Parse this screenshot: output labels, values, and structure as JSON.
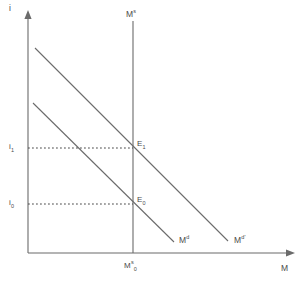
{
  "figure": {
    "type": "economics-line-diagram",
    "background_color": "#ffffff",
    "line_color": "#6b6b6b",
    "text_color": "#4a4a4a"
  },
  "axes": {
    "y": {
      "name": "i",
      "meaning": "interest rate",
      "has_arrow": true,
      "origin_px": [
        28,
        253
      ],
      "end_px": [
        28,
        14
      ]
    },
    "x": {
      "name": "M",
      "meaning": "quantity of money",
      "has_arrow": true,
      "origin_px": [
        28,
        253
      ],
      "end_px": [
        292,
        253
      ]
    }
  },
  "ticks": {
    "y": [
      {
        "label_main": "i",
        "label_sub": "1",
        "y_px": 148
      },
      {
        "label_main": "i",
        "label_sub": "0",
        "y_px": 204
      }
    ],
    "x": [
      {
        "label_main": "M",
        "label_sup": "s",
        "label_sub": "0",
        "x_px": 133
      }
    ]
  },
  "curves": [
    {
      "id": "money-supply",
      "label_main": "M",
      "label_sup": "s",
      "orientation": "vertical",
      "description": "vertical money supply curve",
      "from_px": [
        133,
        21
      ],
      "to_px": [
        133,
        253
      ],
      "label_px": [
        126,
        14
      ]
    },
    {
      "id": "money-demand",
      "label_main": "M",
      "label_sup": "d",
      "orientation": "downward-sloping",
      "description": "original money demand curve",
      "from_px": [
        33,
        103
      ],
      "to_px": [
        174,
        242
      ],
      "label_px": [
        179,
        239
      ]
    },
    {
      "id": "money-demand-shifted",
      "label_main": "M",
      "label_sup": "d'",
      "orientation": "downward-sloping",
      "description": "shifted-right money demand curve",
      "from_px": [
        35,
        48
      ],
      "to_px": [
        228,
        241
      ],
      "label_px": [
        234,
        239
      ]
    }
  ],
  "equilibria": [
    {
      "id": "E0",
      "label_main": "E",
      "label_sub": "0",
      "point_px": [
        133,
        204
      ],
      "label_px": [
        137,
        198
      ],
      "interest_rate_tick": "i0",
      "money_tick": "Ms0"
    },
    {
      "id": "E1",
      "label_main": "E",
      "label_sub": "1",
      "point_px": [
        133,
        148
      ],
      "label_px": [
        137,
        142
      ],
      "interest_rate_tick": "i1",
      "money_tick": "Ms0"
    }
  ],
  "guides": [
    {
      "id": "guide-i1",
      "style": "dotted",
      "from_px": [
        28,
        148
      ],
      "to_px": [
        133,
        148
      ]
    },
    {
      "id": "guide-i0",
      "style": "dotted",
      "from_px": [
        28,
        204
      ],
      "to_px": [
        133,
        204
      ]
    }
  ]
}
